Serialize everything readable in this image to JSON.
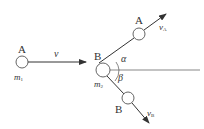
{
  "diagram": {
    "type": "elastic collision of two balls",
    "before": {
      "ball": {
        "name": "A",
        "mass": "m",
        "mass_sub": "1"
      },
      "velocity": {
        "label": "v"
      }
    },
    "after": {
      "target": {
        "name": "B",
        "mass": "m",
        "mass_sub": "2"
      },
      "ball_a": {
        "name": "A",
        "velocity": "v",
        "velocity_sub": "A"
      },
      "ball_b": {
        "name": "B",
        "velocity": "v",
        "velocity_sub": "B"
      },
      "angle_a": "α",
      "angle_b": "β"
    },
    "colors": {
      "line": "#333333",
      "circle": "#555555",
      "text": "#333333"
    }
  }
}
